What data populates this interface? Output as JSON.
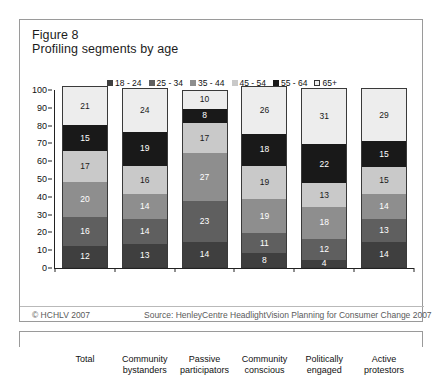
{
  "figure": {
    "title_line1": "Figure 8",
    "title_line2": "Profiling segments by age"
  },
  "footer": {
    "copyright": "© HCHLV 2007",
    "source": "Source: HenleyCentre HeadlightVision Planning for Consumer Change 2007"
  },
  "chart_data": {
    "type": "bar",
    "subtype": "stacked-column",
    "title": "Profiling segments by age",
    "xlabel": "",
    "ylabel": "",
    "ylim": [
      0,
      100
    ],
    "yticks": [
      0,
      10,
      20,
      30,
      40,
      50,
      60,
      70,
      80,
      90,
      100
    ],
    "ytick_labels": [
      "0",
      "10",
      "20",
      "30",
      "40",
      "50",
      "60",
      "70",
      "80",
      "90",
      "100"
    ],
    "grid": false,
    "legend_position": "top-center",
    "categories": [
      "Total",
      "Community bystanders",
      "Passive participators",
      "Community conscious",
      "Politically engaged",
      "Active protestors"
    ],
    "category_lines": [
      [
        "Total"
      ],
      [
        "Community",
        "bystanders"
      ],
      [
        "Passive",
        "participators"
      ],
      [
        "Community",
        "conscious"
      ],
      [
        "Politically",
        "engaged"
      ],
      [
        "Active",
        "protestors"
      ]
    ],
    "series": [
      {
        "name": "18 - 24",
        "color": "#3f3f3f",
        "text_color": "#ffffff",
        "values": [
          12,
          13,
          14,
          8,
          4,
          14
        ]
      },
      {
        "name": "25 - 34",
        "color": "#5f5f5f",
        "text_color": "#ffffff",
        "values": [
          16,
          14,
          23,
          11,
          12,
          13
        ]
      },
      {
        "name": "35 - 44",
        "color": "#8e8e8e",
        "text_color": "#ffffff",
        "values": [
          20,
          14,
          27,
          19,
          18,
          14
        ]
      },
      {
        "name": "45 - 54",
        "color": "#c9c9c9",
        "text_color": "#1a1a1a",
        "values": [
          17,
          16,
          17,
          19,
          13,
          15
        ]
      },
      {
        "name": "55 - 64",
        "color": "#191919",
        "text_color": "#ffffff",
        "values": [
          15,
          19,
          8,
          18,
          22,
          15
        ]
      },
      {
        "name": "65+",
        "color": "#ededed",
        "text_color": "#1a1a1a",
        "values": [
          21,
          24,
          10,
          26,
          31,
          29
        ]
      }
    ]
  }
}
